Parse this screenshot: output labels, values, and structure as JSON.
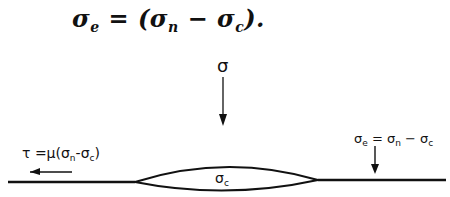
{
  "equation": {
    "lhs_symbol": "σ",
    "lhs_sub": "e",
    "equals": " = (",
    "term1_symbol": "σ",
    "term1_sub": "n",
    "minus": " − ",
    "term2_symbol": "σ",
    "term2_sub": "c",
    "close": ")."
  },
  "diagram": {
    "applied_stress_label": "σ",
    "contact_label_symbol": "σ",
    "contact_label_sub": "c",
    "shear_label": {
      "prefix": "τ =μ(",
      "s1": "σ",
      "s1_sub": "n",
      "minus": "-",
      "s2": "σ",
      "s2_sub": "c",
      "close": ")"
    },
    "effective_label": {
      "s_e": "σ",
      "s_e_sub": "e",
      "eq": " = ",
      "s_n": "σ",
      "s_n_sub": "n",
      "minus": " − ",
      "s_c": "σ",
      "s_c_sub": "c"
    },
    "colors": {
      "ink": "#111111",
      "background": "#ffffff"
    }
  }
}
